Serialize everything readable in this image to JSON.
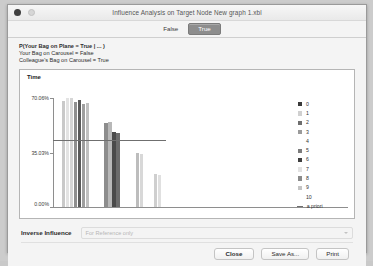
{
  "window": {
    "title": "Influence Analysis on Target Node New graph 1.xbl",
    "close_dot": "close-dot",
    "minimize_dot": "minimize-dot"
  },
  "tabs": [
    {
      "label": "False",
      "selected": false
    },
    {
      "label": "True",
      "selected": true
    }
  ],
  "query": {
    "line1": "P(Your Bag on Plane = True | ... )",
    "line2": "Your Bag on Carousel = False",
    "line3": "Colleague's Bag on Carousel = True"
  },
  "inverse": {
    "label": "Inverse Influence",
    "placeholder": "For Reference only",
    "caret": "chevron-down-icon"
  },
  "footer": {
    "close": "Close",
    "save_as": "Save As...",
    "print": "Print"
  },
  "chart_data": {
    "type": "bar",
    "title": "Time",
    "xlabel": "",
    "ylabel": "",
    "ylim": [
      0,
      70.06
    ],
    "ytick_labels": [
      "70.06%",
      "35.03%",
      "0.00%"
    ],
    "ytick_values": [
      70.06,
      35.03,
      0.0
    ],
    "grid": false,
    "legend_position": "right",
    "legend_entries": [
      {
        "label": "0",
        "color": "#3a3a3a"
      },
      {
        "label": "1",
        "color": "#d0d0d0"
      },
      {
        "label": "2",
        "color": "#6e6e6e"
      },
      {
        "label": "3",
        "color": "#9a9a9a"
      },
      {
        "label": "4",
        "color": "#ffffff"
      },
      {
        "label": "5",
        "color": "#7c7c7c"
      },
      {
        "label": "6",
        "color": "#3f3f3f"
      },
      {
        "label": "7",
        "color": "#e2e2e2"
      },
      {
        "label": "8",
        "color": "#8a8a8a"
      },
      {
        "label": "9",
        "color": "#c4c4c4"
      },
      {
        "label": "10",
        "color": "#ffffff"
      }
    ],
    "reference_line": {
      "label": "a priori",
      "value": 42.5,
      "color": "#6f6f6f"
    },
    "groups": [
      {
        "name": "group-1",
        "x_left_pct": 6,
        "bars": [
          {
            "series": "0",
            "value": 68.0,
            "color": "#c9c9c9"
          },
          {
            "series": "1",
            "value": 69.5,
            "color": "#e3e3e3"
          },
          {
            "series": "2",
            "value": 70.06,
            "color": "#d6d6d6"
          },
          {
            "series": "3",
            "value": 67.5,
            "color": "#8f8f8f"
          },
          {
            "series": "4",
            "value": 68.5,
            "color": "#5a5a5a"
          },
          {
            "series": "5",
            "value": 66.0,
            "color": "#9e9e9e"
          },
          {
            "series": "6",
            "value": 66.5,
            "color": "#c0c0c0"
          }
        ]
      },
      {
        "name": "group-2",
        "x_left_pct": 44,
        "bars": [
          {
            "series": "0",
            "value": 54.0,
            "color": "#8d8d8d"
          },
          {
            "series": "1",
            "value": 54.5,
            "color": "#b8b8b8"
          },
          {
            "series": "2",
            "value": 48.0,
            "color": "#4a4a4a"
          },
          {
            "series": "3",
            "value": 47.5,
            "color": "#6b6b6b"
          }
        ]
      },
      {
        "name": "group-3",
        "x_left_pct": 72,
        "bars": [
          {
            "series": "0",
            "value": 34.5,
            "color": "#bdbdbd"
          },
          {
            "series": "1",
            "value": 34.0,
            "color": "#d8d8d8"
          }
        ]
      },
      {
        "name": "group-4",
        "x_left_pct": 88,
        "bars": [
          {
            "series": "0",
            "value": 21.0,
            "color": "#cfcfcf"
          },
          {
            "series": "1",
            "value": 20.5,
            "color": "#e0e0e0"
          }
        ]
      }
    ]
  }
}
